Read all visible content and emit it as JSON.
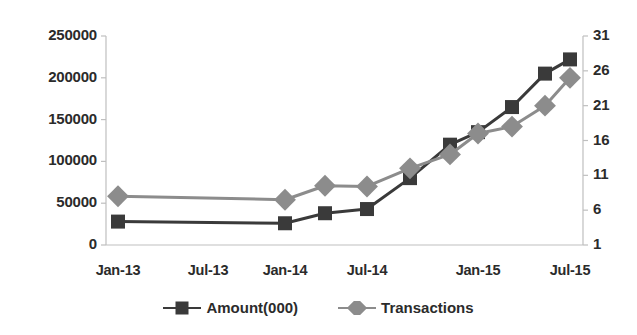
{
  "chart_data": {
    "type": "line",
    "title": "",
    "xlabel": "",
    "ylabel": "",
    "grid": false,
    "legend_position": "bottom",
    "x": [
      "Jan-13",
      "Jul-13",
      "Oct-13",
      "Jan-14",
      "Apr-14",
      "Jul-14",
      "Oct-14",
      "Jan-15",
      "Apr-15",
      "Jul-15"
    ],
    "x_tick_labels": [
      "Jan-13",
      "Jul-13",
      "Jan-14",
      "Jul-14",
      "Jan-15",
      "Jul-15"
    ],
    "y_left_tick_labels": [
      "250000",
      "200000",
      "150000",
      "100000",
      "50000",
      "0"
    ],
    "y_left_ticks": [
      250000,
      200000,
      150000,
      100000,
      50000,
      0
    ],
    "y_right_tick_labels": [
      "31",
      "26",
      "21",
      "16",
      "11",
      "6",
      "1"
    ],
    "y_right_ticks": [
      31,
      26,
      21,
      16,
      11,
      6,
      1
    ],
    "ylim_left": [
      0,
      250000
    ],
    "ylim_right": [
      1,
      31
    ],
    "series": [
      {
        "name": "Amount(000)",
        "axis": "left",
        "color": "#3a3a3a",
        "marker": "square",
        "values": [
          28000,
          26000,
          38000,
          43000,
          80000,
          120000,
          135000,
          165000,
          205000,
          222000
        ]
      },
      {
        "name": "Transactions",
        "axis": "right",
        "color": "#8c8c8c",
        "marker": "diamond",
        "values": [
          8.0,
          7.5,
          9.5,
          9.4,
          12.0,
          14.0,
          17.0,
          18.0,
          21.0,
          25.0
        ]
      }
    ]
  },
  "legend": {
    "items": [
      {
        "label": "Amount(000)",
        "color": "#3a3a3a",
        "marker": "square"
      },
      {
        "label": "Transactions",
        "color": "#8c8c8c",
        "marker": "diamond"
      }
    ]
  },
  "axis_colors": {
    "axis_line": "#bfbfbf",
    "tick": "#bfbfbf",
    "text": "#2b2b2b"
  }
}
